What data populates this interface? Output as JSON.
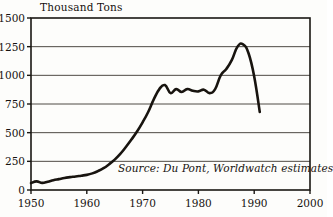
{
  "chart_data": {
    "type": "line",
    "title": "",
    "ylabel": "Thousand Tons",
    "xlabel": "",
    "xlim": [
      1950,
      2000
    ],
    "ylim": [
      0,
      1500
    ],
    "grid": true,
    "legend": false,
    "annotation": "Source: Du Pont, Worldwatch estimates",
    "y_ticks": [
      "0",
      "250",
      "500",
      "750",
      "1000",
      "1250",
      "1500"
    ],
    "y_tick_values": [
      0,
      250,
      500,
      750,
      1000,
      1250,
      1500
    ],
    "x_ticks": [
      "1950",
      "1960",
      "1970",
      "1980",
      "1990",
      "2000"
    ],
    "x_tick_values": [
      1950,
      1960,
      1970,
      1980,
      1990,
      2000
    ],
    "series_name": "CFC production",
    "line_color": "#18140f",
    "x": [
      1950,
      1951,
      1952,
      1953,
      1954,
      1955,
      1956,
      1957,
      1958,
      1959,
      1960,
      1961,
      1962,
      1963,
      1964,
      1965,
      1966,
      1967,
      1968,
      1969,
      1970,
      1971,
      1972,
      1973,
      1974,
      1975,
      1976,
      1977,
      1978,
      1979,
      1980,
      1981,
      1982,
      1983,
      1984,
      1985,
      1986,
      1987,
      1988,
      1989,
      1990,
      1991
    ],
    "values": [
      60,
      75,
      62,
      72,
      85,
      95,
      105,
      112,
      118,
      125,
      132,
      145,
      165,
      190,
      225,
      265,
      315,
      375,
      440,
      510,
      590,
      680,
      790,
      880,
      915,
      845,
      880,
      855,
      880,
      865,
      860,
      875,
      845,
      880,
      1000,
      1055,
      1135,
      1250,
      1270,
      1190,
      990,
      680
    ],
    "peak": {
      "year": 1988,
      "value": 1270
    },
    "end_point": {
      "year": 1991,
      "value": 680
    }
  },
  "labels": {
    "y_axis_title": "Thousand Tons",
    "source": "Source: Du Pont, Worldwatch estimates"
  }
}
